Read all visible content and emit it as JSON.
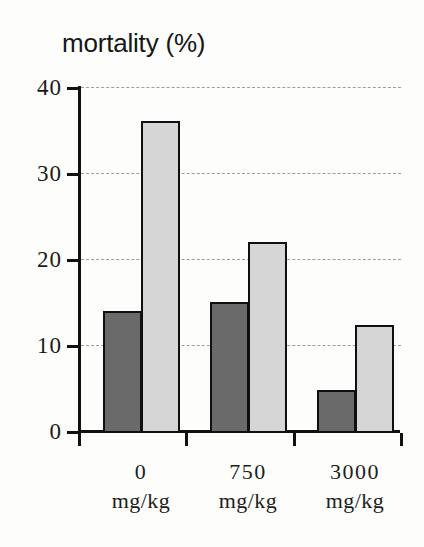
{
  "chart_data": {
    "type": "bar",
    "title": "mortality (%)",
    "xlabel": "",
    "ylabel": "mortality (%)",
    "categories": [
      "0 mg/kg",
      "750 mg/kg",
      "3000 mg/kg"
    ],
    "category_values": [
      "0",
      "750",
      "3000"
    ],
    "category_units": [
      "mg/kg",
      "mg/kg",
      "mg/kg"
    ],
    "series": [
      {
        "name": "dark",
        "color": "#6a6a6a",
        "values": [
          14,
          15,
          4.8
        ]
      },
      {
        "name": "light",
        "color": "#d6d6d6",
        "values": [
          36,
          22,
          12.3
        ]
      }
    ],
    "ylim": [
      0,
      40
    ],
    "yticks": [
      0,
      10,
      20,
      30,
      40
    ],
    "ytick_labels": [
      "0",
      "10",
      "20",
      "30",
      "40"
    ],
    "grid": true,
    "grid_style": "dash-dot",
    "legend": "none",
    "legend_position": "none"
  },
  "axes": {
    "y_tick_labels": [
      "40",
      "30",
      "20",
      "10",
      "0"
    ],
    "y_tick_values": [
      40,
      30,
      20,
      10,
      0
    ]
  },
  "colors": {
    "background": "#fdfdfb",
    "axis": "#111111",
    "grid": "#8e8e8e",
    "bar_dark": "#6a6a6a",
    "bar_light": "#d6d6d6",
    "bar_outline": "#101010",
    "text": "#1a1a1a"
  }
}
